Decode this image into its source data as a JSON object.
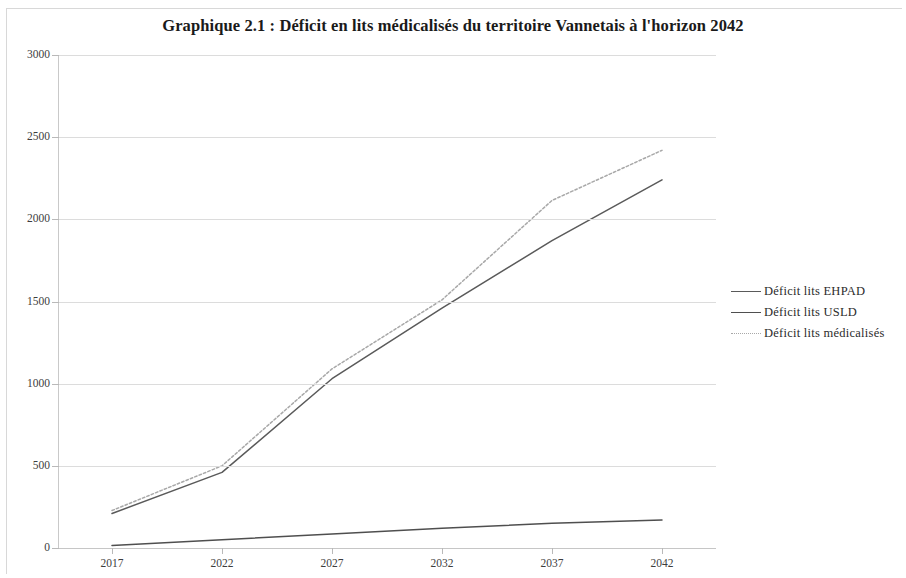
{
  "chart_data": {
    "type": "line",
    "title": "Graphique 2.1 : Déficit en lits médicalisés du territoire Vannetais à l'horizon 2042",
    "xlabel": "",
    "ylabel": "",
    "categories": [
      "2017",
      "2022",
      "2027",
      "2032",
      "2037",
      "2042"
    ],
    "x_tick_labels": [
      "2017",
      "2022",
      "2027",
      "2032",
      "2037",
      "2042"
    ],
    "y_tick_labels": [
      "0",
      "500",
      "1000",
      "1500",
      "2000",
      "2500",
      "3000"
    ],
    "y_tick_values": [
      0,
      500,
      1000,
      1500,
      2000,
      2500,
      3000
    ],
    "ylim": [
      0,
      3000
    ],
    "grid": true,
    "legend_position": "right",
    "series": [
      {
        "name": "Déficit lits EHPAD",
        "color": "#5a5a5a",
        "style": "solid",
        "values": [
          210,
          460,
          1030,
          1460,
          1870,
          2240
        ]
      },
      {
        "name": "Déficit lits USLD",
        "color": "#4f4f4f",
        "style": "solid",
        "values": [
          15,
          50,
          85,
          120,
          150,
          170
        ]
      },
      {
        "name": "Déficit lits médicalisés",
        "color": "#a8a8a8",
        "style": "dotted",
        "values": [
          228,
          500,
          1090,
          1510,
          2115,
          2420
        ]
      }
    ]
  },
  "legend": {
    "items": [
      {
        "label": "Déficit lits EHPAD",
        "swatch": "legend-line-ehpad"
      },
      {
        "label": "Déficit lits USLD",
        "swatch": "legend-line-usld"
      },
      {
        "label": "Déficit lits médicalisés",
        "swatch": "legend-line-medicalises"
      }
    ]
  }
}
